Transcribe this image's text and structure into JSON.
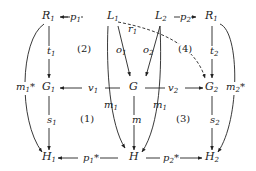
{
  "nodes": {
    "R1_left": "R",
    "R1_left_sub": "1",
    "L1": "L",
    "L1_sub": "1",
    "L2": "L",
    "L2_sub": "2",
    "R_right": "R",
    "R_right_sub": "1",
    "G1": "G",
    "G1_sub": "1",
    "G": "G",
    "G2": "G",
    "G2_sub": "2",
    "H1": "H",
    "H1_sub": "1",
    "H": "H",
    "H2": "H",
    "H2_sub": "2"
  },
  "edges": {
    "p1": "p",
    "p1_sub": "1",
    "p2": "p",
    "p2_sub": "2",
    "t1": "t",
    "t1_sub": "1",
    "t2": "t",
    "t2_sub": "2",
    "o1": "o",
    "o1_sub": "1",
    "o2": "o",
    "o2_sub": "2",
    "r1": "r",
    "r1_sub": "1",
    "v1": "v",
    "v1_sub": "1",
    "v2": "v",
    "v2_sub": "2",
    "m1_star": "m",
    "m1_star_sub": "1",
    "m1_star_mark": "*",
    "m2_star": "m",
    "m2_star_sub": "2",
    "m2_star_mark": "*",
    "m": "m",
    "m1_left": "m",
    "m1_left_sub": "1",
    "m1_right": "m",
    "m1_right_sub": "1",
    "s1": "s",
    "s1_sub": "1",
    "s2": "s",
    "s2_sub": "2",
    "p1_star": "p",
    "p1_star_sub": "1",
    "p1_star_mark": "*",
    "p2_star": "p",
    "p2_star_sub": "2",
    "p2_star_mark": "*"
  },
  "regions": {
    "r1": "(1)",
    "r2": "(2)",
    "r3": "(3)",
    "r4": "(4)"
  }
}
